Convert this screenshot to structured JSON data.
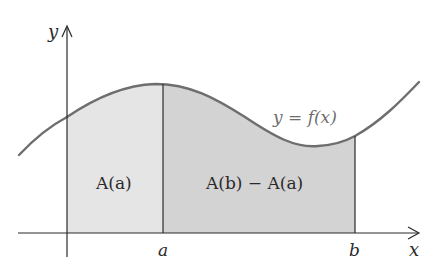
{
  "diagram": {
    "type": "area-under-curve",
    "axes": {
      "x_label": "x",
      "y_label": "y"
    },
    "curve_label": "y = f(x)",
    "markers": {
      "a_label": "a",
      "b_label": "b"
    },
    "regions": [
      {
        "label": "A(a)",
        "span": "origin to a",
        "fill": "#e5e5e5"
      },
      {
        "label": "A(b) − A(a)",
        "span": "a to b",
        "fill": "#d3d3d3"
      }
    ],
    "colors": {
      "curve": "#6e6e6e",
      "axis": "#2a2a2a",
      "background": "#ffffff"
    }
  }
}
